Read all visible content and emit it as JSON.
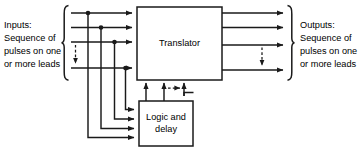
{
  "diagram": {
    "colors": {
      "line": "#1a1a1a",
      "box_fill": "#ffffff",
      "background": "#ffffff",
      "text": "#000000"
    },
    "labels": {
      "inputs": {
        "line1": "Inputs:",
        "line2": "Sequence of",
        "line3": "pulses on one",
        "line4": "or more leads"
      },
      "outputs": {
        "line1": "Outputs:",
        "line2": "Sequence of",
        "line3": "pulses on one",
        "line4": "or more leads"
      }
    },
    "blocks": {
      "translator": {
        "label": "Translator",
        "x": 137,
        "y": 7,
        "width": 85,
        "height": 73
      },
      "logic_delay": {
        "label_line1": "Logic and",
        "label_line2": "delay",
        "x": 139,
        "y": 101,
        "width": 54,
        "height": 45
      }
    },
    "signals": {
      "input_lines": 4,
      "output_lines": 4,
      "feedback_arrows": 3,
      "logic_input_arrows": 4,
      "input_ellipsis": "vertical-dashed-arrow",
      "output_ellipsis": "vertical-dashed-arrow",
      "feedback_ellipsis": "horizontal-dashed-arrow"
    },
    "braces": {
      "input_brace": "left-curly-brace",
      "output_brace": "right-curly-brace"
    }
  }
}
